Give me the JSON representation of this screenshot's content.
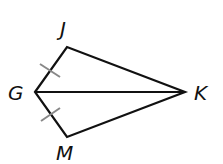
{
  "figure": {
    "type": "kite",
    "points": {
      "G": {
        "label": "G",
        "x": 35,
        "y": 92
      },
      "J": {
        "label": "J",
        "x": 67,
        "y": 47
      },
      "K": {
        "label": "K",
        "x": 185,
        "y": 92
      },
      "M": {
        "label": "M",
        "x": 67,
        "y": 137
      }
    },
    "segments": [
      "GJ",
      "JK",
      "KM",
      "MG",
      "GK"
    ],
    "congruence_marks": [
      "GJ",
      "GM"
    ],
    "colors": {
      "line": "#111111",
      "tick": "#888888",
      "background": "#ffffff"
    }
  }
}
